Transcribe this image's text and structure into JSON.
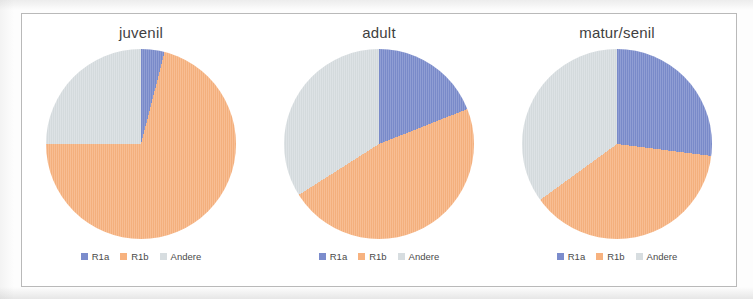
{
  "figure": {
    "legend_labels": [
      "R1a",
      "R1b",
      "Andere"
    ],
    "colors": {
      "R1a": "#7b8ccc",
      "R1b": "#f7b27f",
      "Andere": "#d7dde0"
    }
  },
  "panels": [
    {
      "title": "juvenil"
    },
    {
      "title": "adult"
    },
    {
      "title": "matur/senil"
    }
  ],
  "chart_data": [
    {
      "type": "pie",
      "title": "juvenil",
      "categories": [
        "R1a",
        "R1b",
        "Andere"
      ],
      "values": [
        4,
        71,
        25
      ],
      "colors": [
        "#7b8ccc",
        "#f7b27f",
        "#d7dde0"
      ],
      "legend_position": "bottom",
      "start_angle_deg": 0,
      "direction": "clockwise"
    },
    {
      "type": "pie",
      "title": "adult",
      "categories": [
        "R1a",
        "R1b",
        "Andere"
      ],
      "values": [
        19,
        47,
        34
      ],
      "colors": [
        "#7b8ccc",
        "#f7b27f",
        "#d7dde0"
      ],
      "legend_position": "bottom",
      "start_angle_deg": 0,
      "direction": "clockwise"
    },
    {
      "type": "pie",
      "title": "matur/senil",
      "categories": [
        "R1a",
        "R1b",
        "Andere"
      ],
      "values": [
        27,
        38,
        35
      ],
      "colors": [
        "#7b8ccc",
        "#f7b27f",
        "#d7dde0"
      ],
      "legend_position": "bottom",
      "start_angle_deg": 0,
      "direction": "clockwise"
    }
  ]
}
